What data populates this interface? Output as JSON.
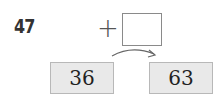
{
  "problem": {
    "number": "47",
    "operator": "+",
    "answer_box": "",
    "start_value": "36",
    "end_value": "63"
  }
}
